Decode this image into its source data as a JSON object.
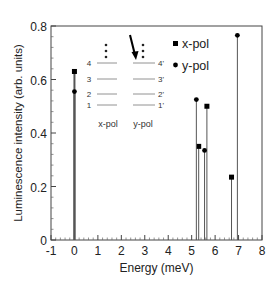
{
  "chart_data": {
    "type": "bar",
    "subtype": "stem",
    "title": "",
    "xlabel": "Energy (meV)",
    "ylabel": "Luminescence intensity (arb. units)",
    "xlim": [
      -1,
      8
    ],
    "ylim": [
      0,
      0.8
    ],
    "xticks": [
      "-1",
      "0",
      "1",
      "2",
      "3",
      "4",
      "5",
      "6",
      "7",
      "8"
    ],
    "yticks": [
      "0",
      "0.2",
      "0.4",
      "0.6",
      "0.8"
    ],
    "grid": false,
    "legend": {
      "position": "upper-right-inside",
      "entries": [
        "x-pol",
        "y-pol"
      ]
    },
    "series": [
      {
        "name": "x-pol",
        "marker": "square",
        "points": [
          {
            "x": 0.0,
            "y": 0.63
          },
          {
            "x": 5.3,
            "y": 0.35
          },
          {
            "x": 5.65,
            "y": 0.5
          },
          {
            "x": 6.7,
            "y": 0.235
          }
        ]
      },
      {
        "name": "y-pol",
        "marker": "circle",
        "points": [
          {
            "x": 0.0,
            "y": 0.555
          },
          {
            "x": 5.2,
            "y": 0.525
          },
          {
            "x": 5.55,
            "y": 0.335
          },
          {
            "x": 6.95,
            "y": 0.765
          }
        ]
      }
    ],
    "inset": {
      "description": "energy level diagram",
      "left_labels": [
        "1",
        "2",
        "3",
        "4"
      ],
      "right_labels": [
        "1'",
        "2'",
        "3'",
        "4'"
      ],
      "left_caption": "x-pol",
      "right_caption": "y-pol",
      "arrow": "points down to level 4'"
    }
  }
}
